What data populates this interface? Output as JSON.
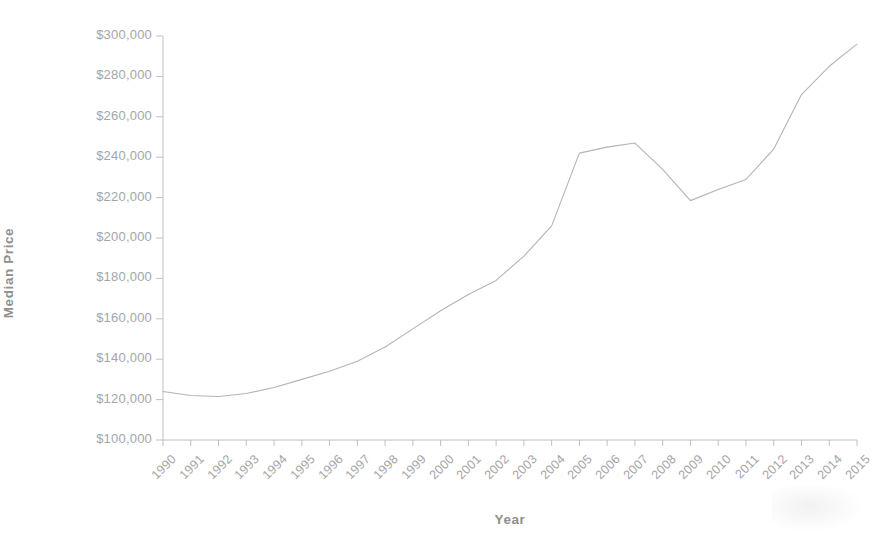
{
  "chart_data": {
    "type": "line",
    "title": "",
    "xlabel": "Year",
    "ylabel": "Median Price",
    "grid": false,
    "legend": null,
    "x": [
      1990,
      1991,
      1992,
      1993,
      1994,
      1995,
      1996,
      1997,
      1998,
      1999,
      2000,
      2001,
      2002,
      2003,
      2004,
      2005,
      2006,
      2007,
      2008,
      2009,
      2010,
      2011,
      2012,
      2013,
      2014,
      2015
    ],
    "categories": [
      "1990",
      "1991",
      "1992",
      "1993",
      "1994",
      "1995",
      "1996",
      "1997",
      "1998",
      "1999",
      "2000",
      "2001",
      "2002",
      "2003",
      "2004",
      "2005",
      "2006",
      "2007",
      "2008",
      "2009",
      "2010",
      "2011",
      "2012",
      "2013",
      "2014",
      "2015"
    ],
    "values": [
      124000,
      122000,
      121500,
      123000,
      126000,
      130000,
      134000,
      139000,
      146000,
      155000,
      164000,
      172000,
      179000,
      191000,
      206000,
      242000,
      245000,
      247000,
      234000,
      218500,
      224000,
      229000,
      244000,
      271000,
      285000,
      296000
    ],
    "series": [
      {
        "name": "Median Price",
        "values": [
          124000,
          122000,
          121500,
          123000,
          126000,
          130000,
          134000,
          139000,
          146000,
          155000,
          164000,
          172000,
          179000,
          191000,
          206000,
          242000,
          245000,
          247000,
          234000,
          218500,
          224000,
          229000,
          244000,
          271000,
          285000,
          296000
        ]
      }
    ],
    "ylim": [
      100000,
      300000
    ],
    "ytick_values": [
      100000,
      120000,
      140000,
      160000,
      180000,
      200000,
      220000,
      240000,
      260000,
      280000,
      300000
    ],
    "ytick_labels": [
      "$100,000",
      "$120,000",
      "$140,000",
      "$160,000",
      "$180,000",
      "$200,000",
      "$220,000",
      "$240,000",
      "$260,000",
      "$280,000",
      "$300,000"
    ],
    "xlim": [
      1990,
      2015
    ],
    "line_color": "#b4b4b4",
    "axis_color": "#c0c0c0",
    "text_color": "#a5a5a5",
    "background_color": "#ffffff"
  },
  "axes": {
    "y_title": "Median Price",
    "x_title": "Year"
  }
}
